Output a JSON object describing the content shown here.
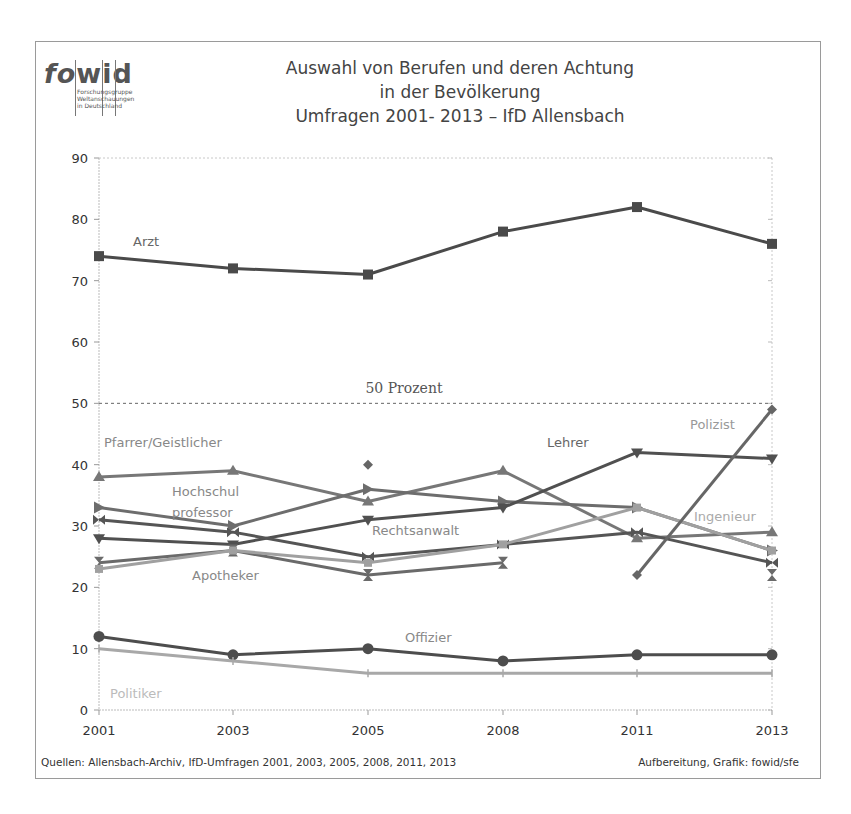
{
  "logo": {
    "word_left": "fo",
    "word_mid": "w",
    "word_right": "i",
    "word_end": "d",
    "subtitle_lines": [
      "Forschungsgruppe",
      "Weltanschauungen",
      "in Deutschland"
    ]
  },
  "title": {
    "line1": "Auswahl von Berufen und deren Achtung",
    "line2": "in der Bevölkerung",
    "line3": "Umfragen 2001- 2013 – IfD Allensbach"
  },
  "reference_line": {
    "label": "50 Prozent",
    "value": 50
  },
  "footer": {
    "sources": "Quellen: Allensbach-Archiv, IfD-Umfragen 2001, 2003, 2005, 2008, 2011, 2013",
    "credit": "Aufbereitung, Grafik: fowid/sfe"
  },
  "chart_data": {
    "type": "line",
    "xlabel": "",
    "ylabel": "",
    "x": [
      "2001",
      "2003",
      "2005",
      "2008",
      "2011",
      "2013"
    ],
    "yticks": [
      0,
      10,
      20,
      30,
      40,
      50,
      60,
      70,
      80,
      90
    ],
    "ylim": [
      0,
      90
    ],
    "grid": false,
    "legend": "inline labels",
    "annotations": [
      {
        "text": "50 Prozent",
        "y": 50,
        "style": "dashed horizontal line"
      }
    ],
    "series": [
      {
        "name": "Arzt",
        "marker": "square",
        "color": "#4a4a4a",
        "values": [
          74,
          72,
          71,
          78,
          82,
          76
        ]
      },
      {
        "name": "Pfarrer/Geistlicher",
        "marker": "triangle-up",
        "color": "#777777",
        "values": [
          38,
          39,
          34,
          39,
          28,
          29
        ]
      },
      {
        "name": "Hochschulprofessor",
        "marker": "triangle-right",
        "color": "#6d6d6d",
        "values": [
          33,
          30,
          36,
          34,
          33,
          26
        ]
      },
      {
        "name": "Lehrer",
        "marker": "triangle-down",
        "color": "#505050",
        "values": [
          28,
          27,
          31,
          33,
          42,
          41
        ]
      },
      {
        "name": "Rechtsanwalt",
        "marker": "bowtie",
        "color": "#555555",
        "values": [
          31,
          29,
          25,
          27,
          29,
          24
        ]
      },
      {
        "name": "Apotheker",
        "marker": "hourglass",
        "color": "#6a6a6a",
        "values": [
          24,
          26,
          22,
          24,
          null,
          22
        ]
      },
      {
        "name": "Ingenieur",
        "marker": "square-light",
        "color": "#a0a0a0",
        "values": [
          23,
          26,
          24,
          27,
          33,
          26
        ]
      },
      {
        "name": "Polizist",
        "marker": "diamond",
        "color": "#666666",
        "values": [
          null,
          null,
          40,
          null,
          22,
          49
        ]
      },
      {
        "name": "Offizier",
        "marker": "circle",
        "color": "#4d4d4d",
        "values": [
          12,
          9,
          10,
          8,
          9,
          9
        ]
      },
      {
        "name": "Politiker",
        "marker": "plus",
        "color": "#a8a8a8",
        "values": [
          10,
          8,
          6,
          6,
          6,
          6
        ]
      }
    ]
  }
}
